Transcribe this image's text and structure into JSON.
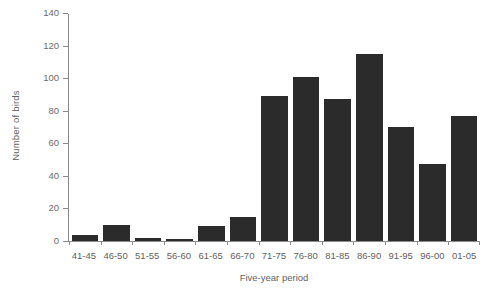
{
  "chart_data": {
    "type": "bar",
    "title": "",
    "subtitle": "",
    "xlabel": "Five-year period",
    "ylabel": "Number of birds",
    "categories": [
      "41-45",
      "46-50",
      "51-55",
      "56-60",
      "61-65",
      "66-70",
      "71-75",
      "76-80",
      "81-85",
      "86-90",
      "91-95",
      "96-00",
      "01-05"
    ],
    "values": [
      4,
      10,
      2,
      1,
      9,
      15,
      89,
      101,
      87,
      115,
      70,
      47,
      77
    ],
    "ylim": [
      0,
      140
    ],
    "yticks": [
      0,
      20,
      40,
      60,
      80,
      100,
      120,
      140
    ],
    "ytick_labels": [
      "0",
      "20",
      "40",
      "60",
      "80",
      "100",
      "120",
      "140"
    ],
    "grid": false,
    "legend": null,
    "bar_color": "#2b2b2b",
    "axis_color": "#8a8a8a",
    "text_color": "#5f5f5f"
  }
}
